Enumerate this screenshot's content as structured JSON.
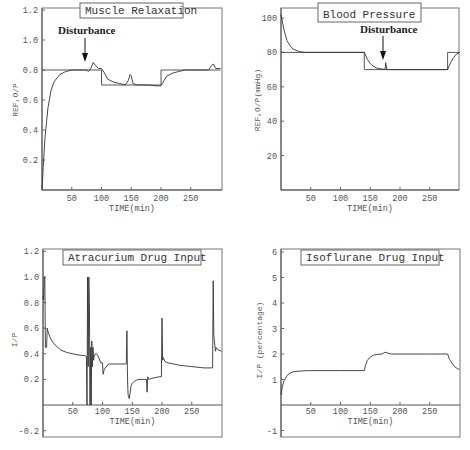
{
  "figure": {
    "panels": [
      {
        "id": "muscle",
        "title": "Muscle Relaxation",
        "ylabel": "REF,O/P",
        "xlabel": "TIME(min)",
        "xticks": [
          "50",
          "100",
          "150",
          "200",
          "250"
        ],
        "yticks": [
          "0.2",
          "0.4",
          "0.6",
          "0.8",
          "1.0",
          "1.2"
        ],
        "annotation": "Disturbance"
      },
      {
        "id": "bp",
        "title": "Blood Pressure",
        "ylabel": "REF,O/P(mmHg)",
        "xlabel": "TIME(min)",
        "xticks": [
          "50",
          "100",
          "150",
          "200",
          "250"
        ],
        "yticks": [
          "20",
          "40",
          "60",
          "80",
          "100"
        ],
        "annotation": "Disturbance"
      },
      {
        "id": "atracurium",
        "title": "Atracurium Drug Input",
        "ylabel": "I/P",
        "xlabel": "TIME(min)",
        "xticks": [
          "50",
          "100",
          "150",
          "200",
          "250"
        ],
        "yticks": [
          "-0.2",
          "0.2",
          "0.4",
          "0.6",
          "0.8",
          "1.0",
          "1.2"
        ]
      },
      {
        "id": "isoflurane",
        "title": "Isoflurane Drug Input",
        "ylabel": "I/P (percentage)",
        "xlabel": "TIME(min)",
        "xticks": [
          "50",
          "100",
          "150",
          "200",
          "250"
        ],
        "yticks": [
          "-1",
          "1",
          "2",
          "3",
          "4",
          "5",
          "6"
        ]
      }
    ]
  },
  "chart_data": [
    {
      "type": "line",
      "title": "Muscle Relaxation",
      "xlabel": "TIME(min)",
      "ylabel": "REF,O/P",
      "xlim": [
        0,
        300
      ],
      "ylim": [
        0,
        1.2
      ],
      "grid": false,
      "annotations": [
        {
          "text": "Disturbance",
          "x": 75,
          "arrow_to_y": 0.82
        }
      ],
      "series": [
        {
          "name": "Reference",
          "x": [
            0,
            100,
            100,
            200,
            200,
            300
          ],
          "y": [
            0.8,
            0.8,
            0.7,
            0.7,
            0.8,
            0.8
          ]
        },
        {
          "name": "Output",
          "x": [
            0,
            2,
            5,
            10,
            15,
            20,
            30,
            40,
            50,
            60,
            72,
            75,
            78,
            82,
            86,
            90,
            95,
            100,
            105,
            110,
            120,
            130,
            140,
            145,
            148,
            150,
            153,
            160,
            170,
            180,
            190,
            200,
            205,
            210,
            220,
            230,
            240,
            250,
            280,
            285,
            288,
            292,
            300
          ],
          "y": [
            0.0,
            0.15,
            0.35,
            0.55,
            0.66,
            0.72,
            0.77,
            0.79,
            0.8,
            0.8,
            0.8,
            0.8,
            0.79,
            0.81,
            0.85,
            0.83,
            0.81,
            0.81,
            0.78,
            0.74,
            0.72,
            0.71,
            0.7,
            0.73,
            0.77,
            0.76,
            0.71,
            0.7,
            0.7,
            0.7,
            0.695,
            0.695,
            0.73,
            0.76,
            0.78,
            0.79,
            0.8,
            0.8,
            0.8,
            0.83,
            0.84,
            0.81,
            0.81
          ]
        }
      ]
    },
    {
      "type": "line",
      "title": "Blood Pressure",
      "xlabel": "TIME(min)",
      "ylabel": "REF,O/P(mmHg)",
      "xlim": [
        0,
        300
      ],
      "ylim": [
        0,
        105
      ],
      "grid": false,
      "annotations": [
        {
          "text": "Disturbance",
          "x": 175,
          "arrow_to_y": 72
        }
      ],
      "series": [
        {
          "name": "Reference",
          "x": [
            0,
            140,
            140,
            280,
            280,
            300
          ],
          "y": [
            80,
            80,
            70,
            70,
            80,
            80
          ]
        },
        {
          "name": "Output",
          "x": [
            0,
            5,
            10,
            15,
            20,
            30,
            40,
            50,
            140,
            145,
            150,
            155,
            160,
            170,
            175,
            176,
            178,
            185,
            200,
            250,
            280,
            285,
            290,
            295,
            300
          ],
          "y": [
            102,
            93,
            87,
            84,
            82,
            80.5,
            80,
            80,
            80,
            76,
            73.5,
            72,
            71,
            70.3,
            70.2,
            74,
            70,
            70,
            70,
            70,
            70,
            74,
            77,
            79,
            80
          ]
        }
      ]
    },
    {
      "type": "line",
      "title": "Atracurium Drug Input",
      "xlabel": "TIME(min)",
      "ylabel": "I/P",
      "xlim": [
        0,
        300
      ],
      "ylim": [
        -0.2,
        1.2
      ],
      "grid": false,
      "series": [
        {
          "name": "Input",
          "x": [
            0,
            1,
            2,
            3,
            4,
            6,
            7,
            8,
            10,
            12,
            15,
            20,
            30,
            40,
            50,
            60,
            70,
            73,
            74,
            75,
            76,
            77,
            78,
            79,
            80,
            81,
            82,
            83,
            84,
            85,
            86,
            88,
            90,
            93,
            97,
            100,
            101,
            103,
            110,
            120,
            140,
            141,
            142,
            143,
            145,
            148,
            150,
            155,
            160,
            170,
            174,
            175,
            176,
            178,
            185,
            195,
            199,
            200,
            201,
            202,
            205,
            210,
            230,
            250,
            270,
            285,
            286,
            287,
            288,
            290,
            291,
            292,
            295,
            300
          ],
          "y": [
            0.85,
            0.82,
            1.0,
            1.0,
            0.45,
            0.45,
            0.6,
            0.58,
            0.55,
            0.53,
            0.5,
            0.47,
            0.43,
            0.41,
            0.4,
            0.39,
            0.385,
            0.38,
            0.0,
            1.0,
            0.3,
            1.0,
            0.8,
            0.0,
            0.45,
            0.0,
            0.5,
            0.3,
            0.45,
            0.35,
            0.38,
            0.4,
            0.4,
            0.38,
            0.33,
            0.33,
            0.24,
            0.28,
            0.32,
            0.32,
            0.32,
            0.58,
            0.2,
            0.08,
            0.05,
            0.15,
            0.17,
            0.19,
            0.2,
            0.2,
            0.2,
            0.1,
            0.22,
            0.2,
            0.21,
            0.22,
            0.22,
            0.68,
            0.35,
            0.37,
            0.34,
            0.33,
            0.31,
            0.3,
            0.29,
            0.29,
            0.97,
            0.55,
            0.5,
            0.42,
            0.45,
            0.44,
            0.43,
            0.42
          ]
        }
      ]
    },
    {
      "type": "line",
      "title": "Isoflurane Drug Input",
      "xlabel": "TIME(min)",
      "ylabel": "I/P (percentage)",
      "xlim": [
        0,
        300
      ],
      "ylim": [
        -1,
        6
      ],
      "grid": false,
      "series": [
        {
          "name": "Input",
          "x": [
            0,
            2,
            5,
            10,
            15,
            20,
            30,
            40,
            50,
            100,
            140,
            142,
            145,
            150,
            155,
            160,
            170,
            175,
            180,
            185,
            200,
            250,
            280,
            283,
            287,
            292,
            297,
            300
          ],
          "y": [
            0.4,
            0.7,
            0.95,
            1.15,
            1.25,
            1.3,
            1.33,
            1.34,
            1.35,
            1.35,
            1.35,
            1.55,
            1.75,
            1.88,
            1.95,
            1.98,
            2.0,
            2.07,
            2.03,
            2.0,
            2.0,
            2.0,
            2.0,
            1.8,
            1.65,
            1.5,
            1.42,
            1.4
          ]
        }
      ]
    }
  ]
}
